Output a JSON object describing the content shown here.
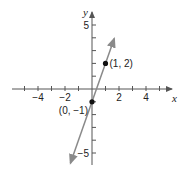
{
  "chart_data": {
    "type": "line",
    "title": "",
    "xlabel": "x",
    "ylabel": "y",
    "xlim": [
      -5.5,
      5.5
    ],
    "ylim": [
      -6,
      6
    ],
    "x_ticks": [
      -4,
      -2,
      2,
      4
    ],
    "y_ticks": [
      5,
      -5
    ],
    "x_tick_labels": [
      "−4",
      "−2",
      "2",
      "4"
    ],
    "y_tick_labels": [
      "5",
      "−5"
    ],
    "grid": false,
    "series": [
      {
        "name": "y = 3x − 1",
        "slope": 3,
        "intercept": -1,
        "color": "#8a8a8a",
        "x": [
          -1.6,
          1.65
        ],
        "y": [
          -5.8,
          3.95
        ]
      }
    ],
    "points": [
      {
        "x": 0,
        "y": -1,
        "label": "(0, −1)"
      },
      {
        "x": 1,
        "y": 2,
        "label": "(1, 2)"
      }
    ]
  },
  "colors": {
    "axis": "#555555",
    "line": "#8a8a8a",
    "point": "#111111"
  }
}
